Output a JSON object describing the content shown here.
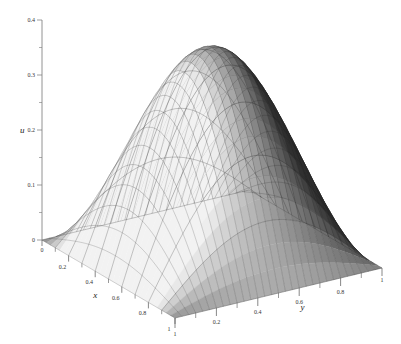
{
  "chart_data": {
    "type": "surface3d",
    "title": "",
    "function_description": "u(x,y) ≈ 0.375·sin(πx)·sin(πy) on unit square",
    "xlabel": "x",
    "ylabel": "y",
    "zlabel": "u",
    "xlim": [
      0,
      1
    ],
    "ylim": [
      0,
      1
    ],
    "zlim": [
      0,
      0.4
    ],
    "x_ticks": [
      "0",
      "0.2",
      "0.4",
      "0.6",
      "0.8",
      "1"
    ],
    "y_ticks": [
      "0.2",
      "0.4",
      "0.6",
      "0.8",
      "1"
    ],
    "z_ticks": [
      "0",
      "0.1",
      "0.2",
      "0.3",
      "0.4"
    ],
    "peak": {
      "x": 0.5,
      "y": 0.5,
      "u": 0.375
    },
    "grid_mesh": {
      "x_lines": 10,
      "y_lines": 30
    },
    "shading": "grayscale lit surface, light from left"
  },
  "labels": {
    "u": "u",
    "x": "x",
    "y": "y"
  }
}
